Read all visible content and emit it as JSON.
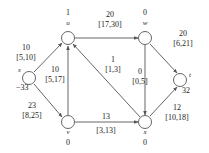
{
  "diagram": {
    "type": "network-flow-graph",
    "stroke_color": "#555555",
    "node_fill": "#ffffff",
    "text_color": "#1c1c1c",
    "nodes": [
      {
        "id": "s",
        "name": "s",
        "value": "−33",
        "cx": 29,
        "cy": 78,
        "r": 7
      },
      {
        "id": "u",
        "name": "u",
        "value": "1",
        "cx": 68,
        "cy": 38,
        "r": 7
      },
      {
        "id": "v",
        "name": "v",
        "value": "0",
        "cx": 68,
        "cy": 122,
        "r": 7
      },
      {
        "id": "w",
        "name": "w",
        "value": "0",
        "cx": 145,
        "cy": 38,
        "r": 7
      },
      {
        "id": "x",
        "name": "x",
        "value": "0",
        "cx": 145,
        "cy": 122,
        "r": 7
      },
      {
        "id": "t",
        "name": "t",
        "value": "32",
        "cx": 180,
        "cy": 80,
        "r": 7
      }
    ],
    "edges": [
      {
        "id": "s-u",
        "from": "s",
        "to": "u",
        "cost": "10",
        "range": "[5,10]"
      },
      {
        "id": "s-v",
        "from": "s",
        "to": "v",
        "cost": "23",
        "range": "[8,25]"
      },
      {
        "id": "v-u",
        "from": "v",
        "to": "u",
        "cost": "10",
        "range": "[5,17]"
      },
      {
        "id": "u-w",
        "from": "u",
        "to": "w",
        "cost": "20",
        "range": "[17,30]"
      },
      {
        "id": "x-u",
        "from": "x",
        "to": "u",
        "cost": "1",
        "range": "[1,3]"
      },
      {
        "id": "v-x",
        "from": "v",
        "to": "x",
        "cost": "13",
        "range": "[3,13]"
      },
      {
        "id": "w-x",
        "from": "w",
        "to": "x",
        "cost": "0",
        "range": "[0,5]"
      },
      {
        "id": "w-t",
        "from": "w",
        "to": "t",
        "cost": "20",
        "range": "[6,21]"
      },
      {
        "id": "x-t",
        "from": "x",
        "to": "t",
        "cost": "12",
        "range": "[10,18]"
      }
    ]
  }
}
